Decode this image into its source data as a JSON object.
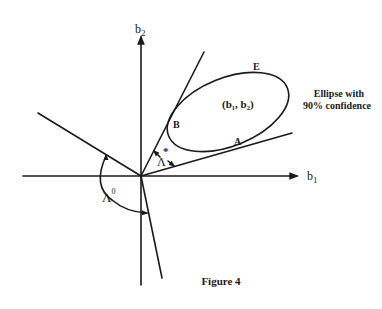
{
  "figure": {
    "caption": "Figure 4",
    "axes": {
      "x_label": "b",
      "x_sub": "1",
      "y_label": "b",
      "y_sub": "2"
    },
    "ellipse": {
      "annotation_line1": "Ellipse with",
      "annotation_line2": "90% confidence",
      "center_label": "(b₁, b₂)",
      "point_E": "E",
      "point_B": "B",
      "point_A": "A"
    },
    "angles": {
      "lambda_star": "Λ",
      "lambda_star_mark": "*",
      "lambda_zero": "Λ",
      "lambda_zero_sup": "0"
    }
  },
  "colors": {
    "ink": "#1a1a1a",
    "background": "#ffffff"
  }
}
